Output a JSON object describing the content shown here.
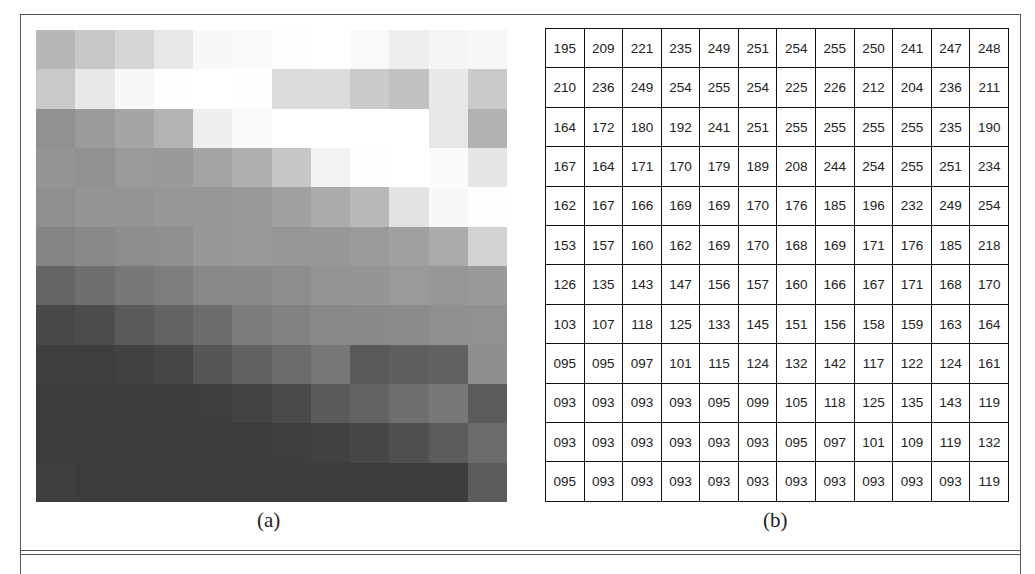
{
  "figure": {
    "caption_a": "(a)",
    "caption_b": "(b)",
    "grid_rows": 12,
    "grid_cols": 12,
    "values": [
      [
        "195",
        "209",
        "221",
        "235",
        "249",
        "251",
        "254",
        "255",
        "250",
        "241",
        "247",
        "248"
      ],
      [
        "210",
        "236",
        "249",
        "254",
        "255",
        "254",
        "225",
        "226",
        "212",
        "204",
        "236",
        "211"
      ],
      [
        "164",
        "172",
        "180",
        "192",
        "241",
        "251",
        "255",
        "255",
        "255",
        "255",
        "235",
        "190"
      ],
      [
        "167",
        "164",
        "171",
        "170",
        "179",
        "189",
        "208",
        "244",
        "254",
        "255",
        "251",
        "234"
      ],
      [
        "162",
        "167",
        "166",
        "169",
        "169",
        "170",
        "176",
        "185",
        "196",
        "232",
        "249",
        "254"
      ],
      [
        "153",
        "157",
        "160",
        "162",
        "169",
        "170",
        "168",
        "169",
        "171",
        "176",
        "185",
        "218"
      ],
      [
        "126",
        "135",
        "143",
        "147",
        "156",
        "157",
        "160",
        "166",
        "167",
        "171",
        "168",
        "170"
      ],
      [
        "103",
        "107",
        "118",
        "125",
        "133",
        "145",
        "151",
        "156",
        "158",
        "159",
        "163",
        "164"
      ],
      [
        "095",
        "095",
        "097",
        "101",
        "115",
        "124",
        "132",
        "142",
        "117",
        "122",
        "124",
        "161"
      ],
      [
        "093",
        "093",
        "093",
        "093",
        "095",
        "099",
        "105",
        "118",
        "125",
        "135",
        "143",
        "119"
      ],
      [
        "093",
        "093",
        "093",
        "093",
        "093",
        "093",
        "095",
        "097",
        "101",
        "109",
        "119",
        "132"
      ],
      [
        "095",
        "093",
        "093",
        "093",
        "093",
        "093",
        "093",
        "093",
        "093",
        "093",
        "093",
        "119"
      ]
    ]
  }
}
